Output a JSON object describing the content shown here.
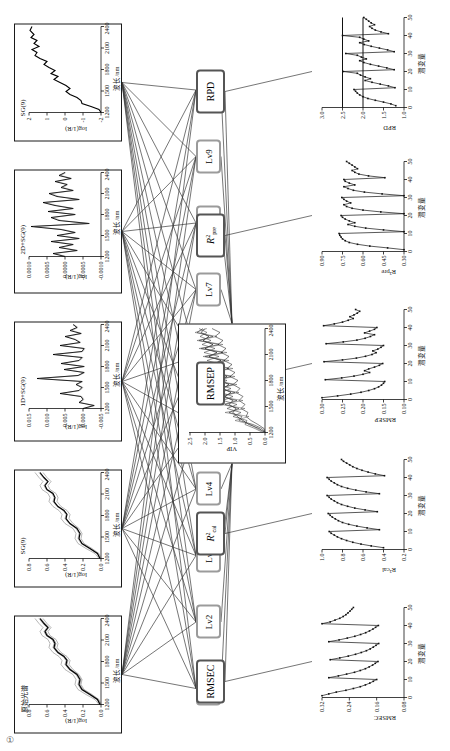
{
  "figure": {
    "orientation": "rotated-90-ccw",
    "corner_mark": "①"
  },
  "spectra_panels": [
    {
      "id": "raw",
      "title": "原始光谱",
      "xlabel": "波长/nm",
      "ylabel": "log(1/R)",
      "xticks": [
        "1200",
        "1500",
        "1800",
        "2100",
        "2400"
      ],
      "yticks": [
        "0.8",
        "0.6",
        "0.4",
        "0.2",
        "0.0"
      ]
    },
    {
      "id": "sg9",
      "title": "SG(9)",
      "xlabel": "波长/nm",
      "ylabel": "log(1/R)",
      "xticks": [
        "1200",
        "1500",
        "1800",
        "2100",
        "2400"
      ],
      "yticks": [
        "0.8",
        "0.6",
        "0.4",
        "0.2",
        "0.0"
      ]
    },
    {
      "id": "d1sg9",
      "title": "1D+SG(9)",
      "xlabel": "波长/nm",
      "ylabel": "log(1/R)",
      "xticks": [
        "1200",
        "1500",
        "1800",
        "2100",
        "2400"
      ],
      "yticks": [
        "0.015",
        "0.010",
        "0.005",
        "0.000",
        "-0.005"
      ]
    },
    {
      "id": "d2sg9",
      "title": "2D+SG(9)",
      "xlabel": "波长/nm",
      "ylabel": "log(1/R)",
      "xticks": [
        "1200",
        "1500",
        "1800",
        "2100",
        "2400"
      ],
      "yticks": [
        "0.0010",
        "0.0005",
        "0.0000",
        "-0.0005",
        "-0.0010"
      ]
    },
    {
      "id": "snv_sg9",
      "title": "SG(9)",
      "xlabel": "波长/nm",
      "ylabel": "log(1/R)",
      "xticks": [
        "1200",
        "1500",
        "1800",
        "2100",
        "2400"
      ],
      "yticks": [
        "2",
        "1",
        "0",
        "-1",
        "-2"
      ]
    }
  ],
  "latent_nodes": [
    {
      "label": "Lv1"
    },
    {
      "label": "Lv2"
    },
    {
      "label": "Lv3"
    },
    {
      "label": "Lv4"
    },
    {
      "label": "Lv5"
    },
    {
      "label": "Lv6"
    },
    {
      "label": "Lv7"
    },
    {
      "label": "Lv8"
    },
    {
      "label": "Lv9"
    },
    {
      "label": "Lv10"
    }
  ],
  "vip_panel": {
    "id": "vip",
    "title": "",
    "xlabel": "波长/nm",
    "ylabel": "VIP",
    "xticks": [
      "1200",
      "1500",
      "1800",
      "2100",
      "2400"
    ],
    "yticks": [
      "2.5",
      "2.0",
      "1.5",
      "1.0",
      "0.5",
      "0.0"
    ]
  },
  "metric_nodes": [
    {
      "id": "rmsec",
      "html": "RMSEC",
      "plain": "RMSEC"
    },
    {
      "id": "r2cal",
      "html": "<i>R</i><sup>2</sup><sub>cal</sub>",
      "plain": "R2cal"
    },
    {
      "id": "rmsep",
      "html": "RMSEP",
      "plain": "RMSEP"
    },
    {
      "id": "r2pre",
      "html": "<i>R</i><sup>2</sup><sub>pre</sub>",
      "plain": "R2pre"
    },
    {
      "id": "rpd",
      "html": "RPD",
      "plain": "RPD"
    }
  ],
  "metric_panels": [
    {
      "id": "rmsec",
      "ylabel": "RMSEC",
      "xlabel": "潜变量",
      "xticks": [
        "0",
        "10",
        "20",
        "30",
        "40",
        "50"
      ],
      "yticks": [
        "0.32",
        "0.24",
        "0.16",
        "0.08"
      ]
    },
    {
      "id": "r2cal",
      "ylabel": "R²cal",
      "xlabel": "潜变量",
      "xticks": [
        "0",
        "10",
        "20",
        "30",
        "40",
        "50"
      ],
      "yticks": [
        "1.0",
        "0.8",
        "0.6",
        "0.4",
        "0.2"
      ]
    },
    {
      "id": "rmsep",
      "ylabel": "RMSEP",
      "xlabel": "潜变量",
      "xticks": [
        "0",
        "10",
        "20",
        "30",
        "40",
        "50"
      ],
      "yticks": [
        "0.30",
        "0.25",
        "0.20",
        "0.15",
        "0.10"
      ]
    },
    {
      "id": "r2pre",
      "ylabel": "R²pre",
      "xlabel": "潜变量",
      "xticks": [
        "0",
        "10",
        "20",
        "30",
        "40",
        "50"
      ],
      "yticks": [
        "0.90",
        "0.75",
        "0.60",
        "0.45",
        "0.30"
      ]
    },
    {
      "id": "rpd",
      "ylabel": "RPD",
      "xlabel": "潜变量",
      "xticks": [
        "0",
        "10",
        "20",
        "30",
        "40",
        "50"
      ],
      "yticks": [
        "3.0",
        "2.5",
        "2.0",
        "1.5",
        "1.0"
      ]
    }
  ],
  "chart_data": [
    {
      "id": "raw",
      "type": "line",
      "title": "原始光谱",
      "xlabel": "波长/nm",
      "ylabel": "log(1/R)",
      "xlim": [
        1100,
        2500
      ],
      "ylim": [
        0.0,
        0.8
      ],
      "note": "overlaid sample bundle, monotone rising with absorption shoulders",
      "x": [
        1100,
        1150,
        1200,
        1250,
        1300,
        1350,
        1400,
        1450,
        1500,
        1550,
        1600,
        1650,
        1700,
        1750,
        1800,
        1850,
        1900,
        1950,
        2000,
        2050,
        2100,
        2150,
        2200,
        2250,
        2300,
        2350,
        2400,
        2450,
        2500
      ],
      "values": [
        0.03,
        0.05,
        0.08,
        0.14,
        0.2,
        0.22,
        0.21,
        0.23,
        0.28,
        0.33,
        0.34,
        0.33,
        0.35,
        0.4,
        0.44,
        0.43,
        0.45,
        0.5,
        0.52,
        0.49,
        0.52,
        0.58,
        0.6,
        0.57,
        0.6,
        0.65,
        0.67,
        0.64,
        0.66
      ]
    },
    {
      "id": "sg9",
      "type": "line",
      "title": "SG(9)",
      "xlabel": "波长/nm",
      "ylabel": "log(1/R)",
      "xlim": [
        1100,
        2500
      ],
      "ylim": [
        0.0,
        0.8
      ],
      "x": [
        1100,
        1150,
        1200,
        1250,
        1300,
        1350,
        1400,
        1450,
        1500,
        1550,
        1600,
        1650,
        1700,
        1750,
        1800,
        1850,
        1900,
        1950,
        2000,
        2050,
        2100,
        2150,
        2200,
        2250,
        2300,
        2350,
        2400,
        2450,
        2500
      ],
      "values": [
        0.03,
        0.05,
        0.08,
        0.14,
        0.2,
        0.22,
        0.21,
        0.23,
        0.28,
        0.33,
        0.34,
        0.33,
        0.35,
        0.4,
        0.44,
        0.43,
        0.45,
        0.5,
        0.52,
        0.49,
        0.52,
        0.58,
        0.6,
        0.57,
        0.6,
        0.65,
        0.67,
        0.64,
        0.66
      ]
    },
    {
      "id": "d1sg9",
      "type": "line",
      "title": "1D+SG(9)",
      "xlabel": "波长/nm",
      "ylabel": "log(1/R)",
      "xlim": [
        1100,
        2500
      ],
      "ylim": [
        -0.005,
        0.015
      ],
      "x": [
        1100,
        1160,
        1220,
        1280,
        1340,
        1400,
        1460,
        1520,
        1580,
        1640,
        1700,
        1760,
        1820,
        1880,
        1940,
        2000,
        2060,
        2120,
        2180,
        2240,
        2300,
        2360,
        2420,
        2480
      ],
      "values": [
        0.0,
        -0.003,
        0.001,
        0.0,
        0.0005,
        0.0065,
        0.001,
        0.0005,
        0.0015,
        0.0005,
        0.0135,
        0.001,
        0.0,
        0.0055,
        0.0,
        0.0065,
        0.001,
        0.0005,
        0.0085,
        0.0005,
        0.0,
        0.0065,
        0.0015,
        0.002
      ]
    },
    {
      "id": "d2sg9",
      "type": "line",
      "title": "2D+SG(9)",
      "xlabel": "波长/nm",
      "ylabel": "log(1/R)",
      "xlim": [
        1100,
        2500
      ],
      "ylim": [
        -0.001,
        0.001
      ],
      "x": [
        1100,
        1160,
        1220,
        1280,
        1340,
        1400,
        1460,
        1520,
        1580,
        1640,
        1700,
        1760,
        1820,
        1880,
        1940,
        2000,
        2060,
        2120,
        2180,
        2240,
        2300,
        2360,
        2420,
        2480
      ],
      "values": [
        0.0,
        0.0003,
        -0.0004,
        0.0002,
        -0.0003,
        0.0004,
        -0.0002,
        0.0003,
        -0.0004,
        0.0002,
        0.0009,
        -0.0006,
        0.0002,
        0.0004,
        -0.0003,
        0.0005,
        -0.0002,
        0.0003,
        0.0006,
        -0.0004,
        0.0003,
        0.0005,
        -0.0002,
        0.0001
      ]
    },
    {
      "id": "snv_sg9",
      "type": "line",
      "title": "SG(9)",
      "xlabel": "波长/nm",
      "ylabel": "log(1/R)",
      "xlim": [
        1100,
        2500
      ],
      "ylim": [
        -2,
        2
      ],
      "x": [
        1100,
        1160,
        1220,
        1280,
        1340,
        1400,
        1460,
        1520,
        1580,
        1640,
        1700,
        1760,
        1820,
        1880,
        1940,
        2000,
        2060,
        2120,
        2180,
        2240,
        2300,
        2360,
        2420,
        2480
      ],
      "values": [
        -1.9,
        -1.8,
        -1.3,
        -0.9,
        -0.9,
        -0.7,
        -0.3,
        -0.1,
        -0.3,
        -0.1,
        0.2,
        0.5,
        0.3,
        0.6,
        0.4,
        0.7,
        0.9,
        0.8,
        1.1,
        1.3,
        1.2,
        1.5,
        1.8,
        1.9
      ]
    },
    {
      "id": "vip",
      "type": "line",
      "title": "VIP",
      "xlabel": "波长/nm",
      "ylabel": "VIP",
      "xlim": [
        1100,
        2500
      ],
      "ylim": [
        0.0,
        2.5
      ],
      "series_count": 5,
      "note": "five overlaid VIP curves, noisy, mean near 1.0"
    },
    {
      "id": "rmsec",
      "type": "line",
      "title": "RMSEC",
      "xlabel": "潜变量",
      "ylabel": "RMSEC",
      "xlim": [
        0,
        50
      ],
      "ylim": [
        0.08,
        0.32
      ],
      "note": "five sawtooth segments, each decaying then resetting at every 10 latent variables",
      "x": [
        1,
        2,
        3,
        4,
        5,
        6,
        7,
        8,
        9,
        10,
        11,
        12,
        13,
        14,
        15,
        16,
        17,
        18,
        19,
        20,
        21,
        22,
        23,
        24,
        25,
        26,
        27,
        28,
        29,
        30,
        31,
        32,
        33,
        34,
        35,
        36,
        37,
        38,
        39,
        40,
        41,
        42,
        43,
        44,
        45,
        46,
        47,
        48,
        49,
        50
      ],
      "values": [
        0.32,
        0.3,
        0.278,
        0.25,
        0.228,
        0.208,
        0.193,
        0.18,
        0.17,
        0.16,
        0.3,
        0.272,
        0.248,
        0.225,
        0.208,
        0.193,
        0.182,
        0.172,
        0.164,
        0.156,
        0.296,
        0.268,
        0.243,
        0.222,
        0.205,
        0.19,
        0.179,
        0.17,
        0.162,
        0.154,
        0.3,
        0.27,
        0.246,
        0.224,
        0.207,
        0.192,
        0.181,
        0.171,
        0.163,
        0.155,
        0.32,
        0.296,
        0.282,
        0.268,
        0.258,
        0.25,
        0.244,
        0.238,
        0.233,
        0.228
      ]
    },
    {
      "id": "r2cal",
      "type": "line",
      "title": "R²cal",
      "xlabel": "潜变量",
      "ylabel": "R²cal",
      "xlim": [
        0,
        50
      ],
      "ylim": [
        0.2,
        1.0
      ],
      "x": [
        1,
        2,
        3,
        4,
        5,
        6,
        7,
        8,
        9,
        10,
        11,
        12,
        13,
        14,
        15,
        16,
        17,
        18,
        19,
        20,
        21,
        22,
        23,
        24,
        25,
        26,
        27,
        28,
        29,
        30,
        31,
        32,
        33,
        34,
        35,
        36,
        37,
        38,
        39,
        40,
        41,
        42,
        43,
        44,
        45,
        46,
        47,
        48,
        49,
        50
      ],
      "values": [
        0.4,
        0.52,
        0.62,
        0.7,
        0.76,
        0.81,
        0.85,
        0.88,
        0.91,
        0.93,
        0.44,
        0.56,
        0.66,
        0.74,
        0.8,
        0.84,
        0.87,
        0.9,
        0.92,
        0.94,
        0.46,
        0.58,
        0.68,
        0.75,
        0.81,
        0.85,
        0.88,
        0.91,
        0.93,
        0.95,
        0.44,
        0.57,
        0.67,
        0.75,
        0.81,
        0.85,
        0.88,
        0.91,
        0.93,
        0.95,
        0.39,
        0.48,
        0.55,
        0.61,
        0.66,
        0.7,
        0.73,
        0.76,
        0.79,
        0.81
      ]
    },
    {
      "id": "rmsep",
      "type": "line",
      "title": "RMSEP",
      "xlabel": "潜变量",
      "ylabel": "RMSEP",
      "xlim": [
        0,
        50
      ],
      "ylim": [
        0.1,
        0.3
      ],
      "x": [
        1,
        2,
        3,
        4,
        5,
        6,
        7,
        8,
        9,
        10,
        11,
        12,
        13,
        14,
        15,
        16,
        17,
        18,
        19,
        20,
        21,
        22,
        23,
        24,
        25,
        26,
        27,
        28,
        29,
        30,
        31,
        32,
        33,
        34,
        35,
        36,
        37,
        38,
        39,
        40,
        41,
        42,
        43,
        44,
        45,
        46,
        47,
        48,
        49,
        50
      ],
      "values": [
        0.3,
        0.262,
        0.23,
        0.205,
        0.186,
        0.172,
        0.162,
        0.155,
        0.15,
        0.147,
        0.292,
        0.252,
        0.222,
        0.2,
        0.184,
        0.196,
        0.186,
        0.172,
        0.16,
        0.152,
        0.295,
        0.25,
        0.216,
        0.194,
        0.178,
        0.168,
        0.176,
        0.164,
        0.156,
        0.15,
        0.29,
        0.248,
        0.215,
        0.195,
        0.182,
        0.172,
        0.196,
        0.184,
        0.172,
        0.166,
        0.296,
        0.27,
        0.25,
        0.236,
        0.224,
        0.232,
        0.222,
        0.214,
        0.208,
        0.218
      ]
    },
    {
      "id": "r2pre",
      "type": "line",
      "title": "R²pre",
      "xlabel": "潜变量",
      "ylabel": "R²pre",
      "xlim": [
        0,
        50
      ],
      "ylim": [
        0.3,
        0.9
      ],
      "x": [
        1,
        2,
        3,
        4,
        5,
        6,
        7,
        8,
        9,
        10,
        11,
        12,
        13,
        14,
        15,
        16,
        17,
        18,
        19,
        20,
        21,
        22,
        23,
        24,
        25,
        26,
        27,
        28,
        29,
        30,
        31,
        32,
        33,
        34,
        35,
        36,
        37,
        38,
        39,
        40,
        41,
        42,
        43,
        44,
        45,
        46,
        47,
        48,
        49,
        50
      ],
      "values": [
        0.3,
        0.42,
        0.55,
        0.64,
        0.7,
        0.73,
        0.75,
        0.76,
        0.77,
        0.775,
        0.3,
        0.45,
        0.58,
        0.66,
        0.71,
        0.66,
        0.7,
        0.73,
        0.75,
        0.76,
        0.3,
        0.47,
        0.6,
        0.68,
        0.72,
        0.74,
        0.69,
        0.72,
        0.74,
        0.755,
        0.3,
        0.46,
        0.59,
        0.67,
        0.71,
        0.74,
        0.66,
        0.7,
        0.73,
        0.74,
        0.44,
        0.56,
        0.63,
        0.66,
        0.68,
        0.64,
        0.66,
        0.68,
        0.7,
        0.72
      ]
    },
    {
      "id": "rpd",
      "type": "line",
      "title": "RPD",
      "xlabel": "潜变量",
      "ylabel": "RPD",
      "xlim": [
        1.0,
        3.0
      ],
      "ylim": [
        1.0,
        3.0
      ],
      "reference_lines": [
        2.0,
        2.5
      ],
      "x": [
        1,
        2,
        3,
        4,
        5,
        6,
        7,
        8,
        9,
        10,
        11,
        12,
        13,
        14,
        15,
        16,
        17,
        18,
        19,
        20,
        21,
        22,
        23,
        24,
        25,
        26,
        27,
        28,
        29,
        30,
        31,
        32,
        33,
        34,
        35,
        36,
        37,
        38,
        39,
        40,
        41,
        42,
        43,
        44,
        45,
        46,
        47,
        48,
        49,
        50
      ],
      "values": [
        1.2,
        1.32,
        1.5,
        1.7,
        1.88,
        2.0,
        2.08,
        2.14,
        2.18,
        2.22,
        1.22,
        1.38,
        1.58,
        1.78,
        1.95,
        1.82,
        1.95,
        2.06,
        2.14,
        2.48,
        1.24,
        1.42,
        1.62,
        1.82,
        1.98,
        2.08,
        1.92,
        2.04,
        2.14,
        2.42,
        1.24,
        1.4,
        1.6,
        1.8,
        1.97,
        2.08,
        1.86,
        1.98,
        2.08,
        2.5,
        1.38,
        1.56,
        1.7,
        1.78,
        1.84,
        1.72,
        1.8,
        1.86,
        1.92,
        1.98
      ]
    }
  ]
}
